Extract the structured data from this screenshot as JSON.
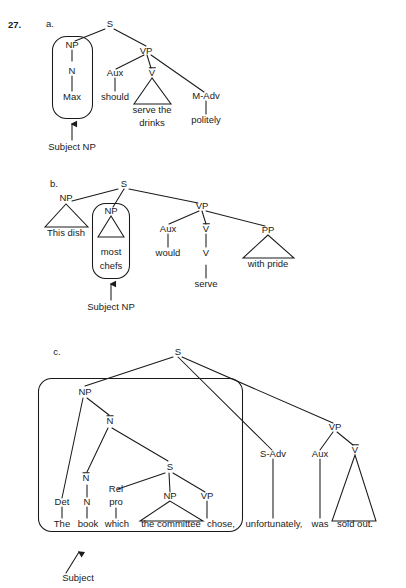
{
  "exercise": {
    "number": "27.",
    "parts": [
      "a.",
      "b.",
      "c."
    ]
  },
  "tree_a": {
    "nodes": {
      "s": "S",
      "np": "NP",
      "n": "N",
      "vp": "VP",
      "aux": "Aux",
      "vbar": "V",
      "madv": "M-Adv"
    },
    "words": {
      "max": "Max",
      "should": "should",
      "serve_the": "serve the",
      "drinks": "drinks",
      "politely": "politely"
    },
    "annotation": "Subject NP"
  },
  "tree_b": {
    "nodes": {
      "s": "S",
      "np_left": "NP",
      "np_boxed": "NP",
      "vp": "VP",
      "aux": "Aux",
      "vbar": "V",
      "v": "V",
      "pp": "PP"
    },
    "words": {
      "this_dish": "This dish",
      "most": "most",
      "chefs": "chefs",
      "would": "would",
      "serve": "serve",
      "with_pride": "with pride"
    },
    "annotation": "Subject NP"
  },
  "tree_c": {
    "nodes": {
      "s_root": "S",
      "np": "NP",
      "nbar_upper": "N",
      "nbar_lower": "N",
      "n": "N",
      "det": "Det",
      "rel": "Rel",
      "pro": "pro",
      "s_embedded": "S",
      "np_inner": "NP",
      "vp_inner": "VP",
      "sadv": "S-Adv",
      "aux": "Aux",
      "vp": "VP",
      "vbar": "V"
    },
    "words": {
      "the": "The",
      "book": "book",
      "which": "which",
      "the_committee": "the committee",
      "chose": "chose,",
      "unfortunately": "unfortunately,",
      "was": "was",
      "sold_out": "sold out."
    },
    "annotation": "Subject"
  },
  "style": {
    "ink": "#1a1a1a",
    "paper": "#ffffff"
  }
}
